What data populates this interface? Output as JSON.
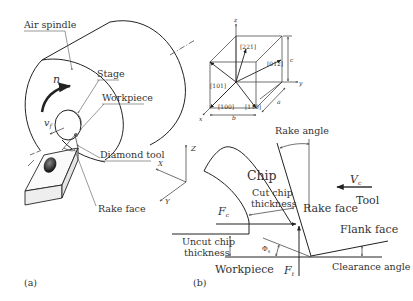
{
  "panel_a": {
    "label": "(a)",
    "callouts": {
      "air_spindle": "Air spindle",
      "stage": "Stage",
      "workpiece": "Workpiece",
      "diamond_tool": "Diamond tool",
      "rake_face": "Rake face"
    },
    "symbols": {
      "rotation": "n",
      "feed_velocity": "v",
      "feed_velocity_sub": "f"
    },
    "axes": {
      "z": "Z",
      "x": "X",
      "y": "Y"
    }
  },
  "crystal_cube": {
    "axes": {
      "z": "z",
      "y": "y",
      "x": "x"
    },
    "directions": [
      "[221]",
      "[012]",
      "[101]",
      "[100]",
      "[110]"
    ],
    "dimensions": {
      "a": "a",
      "b": "b",
      "c": "c"
    }
  },
  "panel_b": {
    "label": "(b)",
    "labels": {
      "rake_angle": "Rake angle",
      "chip": "Chip",
      "cut_chip_thickness_1": "Cut chip",
      "cut_chip_thickness_2": "thickness",
      "rake_face": "Rake face",
      "tool": "Tool",
      "flank_face": "Flank face",
      "uncut_chip_thickness_1": "Uncut chip",
      "uncut_chip_thickness_2": "thickness",
      "workpiece": "Workpiece",
      "clearance_angle": "Clearance angle"
    },
    "symbols": {
      "cutting_velocity": "V",
      "cutting_velocity_sub": "c",
      "cutting_force": "F",
      "cutting_force_sub": "c",
      "thrust_force": "F",
      "thrust_force_sub": "t",
      "shear_angle": "Φ",
      "shear_angle_sub": "s"
    }
  }
}
